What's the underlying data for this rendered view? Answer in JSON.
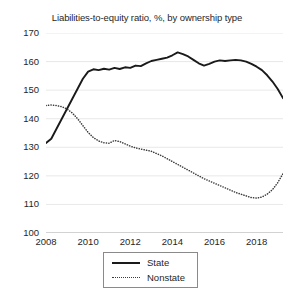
{
  "chart_data": {
    "type": "line",
    "title": "Liabilities-to-equity ratio, %, by ownership type",
    "xlabel": "",
    "ylabel": "",
    "ylim": [
      100,
      170
    ],
    "xlim": [
      2008,
      2019.25
    ],
    "grid": true,
    "legend_position": "bottom-center",
    "yticks": [
      100,
      110,
      120,
      130,
      140,
      150,
      160,
      170
    ],
    "xticks": [
      2008,
      2010,
      2012,
      2014,
      2016,
      2018
    ],
    "series": [
      {
        "name": "State",
        "style": "solid",
        "color": "#1a1a1a",
        "x": [
          2008.0,
          2008.25,
          2008.5,
          2008.75,
          2009.0,
          2009.25,
          2009.5,
          2009.75,
          2010.0,
          2010.25,
          2010.5,
          2010.75,
          2011.0,
          2011.25,
          2011.5,
          2011.75,
          2012.0,
          2012.25,
          2012.5,
          2012.75,
          2013.0,
          2013.25,
          2013.5,
          2013.75,
          2014.0,
          2014.25,
          2014.5,
          2014.75,
          2015.0,
          2015.25,
          2015.5,
          2015.75,
          2016.0,
          2016.25,
          2016.5,
          2016.75,
          2017.0,
          2017.25,
          2017.5,
          2017.75,
          2018.0,
          2018.25,
          2018.5,
          2018.75,
          2019.0,
          2019.25
        ],
        "values": [
          131.5,
          133.0,
          136.5,
          140.0,
          143.5,
          147.0,
          150.5,
          154.0,
          156.5,
          157.3,
          157.0,
          157.5,
          157.2,
          157.8,
          157.4,
          158.0,
          157.8,
          158.6,
          158.4,
          159.4,
          160.2,
          160.6,
          161.0,
          161.4,
          162.2,
          163.2,
          162.6,
          161.8,
          160.6,
          159.4,
          158.6,
          159.2,
          160.0,
          160.4,
          160.2,
          160.4,
          160.6,
          160.4,
          160.0,
          159.2,
          158.2,
          157.0,
          155.2,
          153.0,
          150.4,
          147.2
        ]
      },
      {
        "name": "Nonstate",
        "style": "dotted",
        "color": "#3a3a3a",
        "x": [
          2008.0,
          2008.25,
          2008.5,
          2008.75,
          2009.0,
          2009.25,
          2009.5,
          2009.75,
          2010.0,
          2010.25,
          2010.5,
          2010.75,
          2011.0,
          2011.25,
          2011.5,
          2011.75,
          2012.0,
          2012.25,
          2012.5,
          2012.75,
          2013.0,
          2013.25,
          2013.5,
          2013.75,
          2014.0,
          2014.25,
          2014.5,
          2014.75,
          2015.0,
          2015.25,
          2015.5,
          2015.75,
          2016.0,
          2016.25,
          2016.5,
          2016.75,
          2017.0,
          2017.25,
          2017.5,
          2017.75,
          2018.0,
          2018.25,
          2018.5,
          2018.75,
          2019.0,
          2019.25
        ],
        "values": [
          144.6,
          144.8,
          144.6,
          144.2,
          143.4,
          142.0,
          140.0,
          137.6,
          135.2,
          133.4,
          132.2,
          131.6,
          131.4,
          132.4,
          132.0,
          131.2,
          130.4,
          129.8,
          129.4,
          129.0,
          128.6,
          127.8,
          127.0,
          126.0,
          125.0,
          124.0,
          123.0,
          122.0,
          121.0,
          120.0,
          119.0,
          118.2,
          117.4,
          116.6,
          115.8,
          115.0,
          114.2,
          113.6,
          113.0,
          112.4,
          112.2,
          112.6,
          113.6,
          115.2,
          117.6,
          120.8
        ]
      }
    ]
  }
}
